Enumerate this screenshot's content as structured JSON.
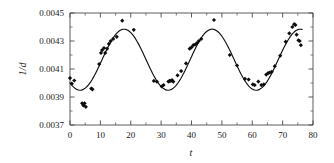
{
  "figure": {
    "background_color": "#ffffff",
    "ink_color": "#111111"
  },
  "chart_data": {
    "type": "scatter",
    "title": "",
    "subtitle": "",
    "xlabel": "t",
    "ylabel": "1/d",
    "xlim": [
      0,
      80
    ],
    "ylim": [
      0.0037,
      0.0045
    ],
    "grid": false,
    "legend": null,
    "legend_position": "none",
    "x_ticks": [
      0,
      10,
      20,
      30,
      40,
      50,
      60,
      70,
      80
    ],
    "x_tick_labels": [
      "0",
      "10",
      "20",
      "30",
      "40",
      "50",
      "60",
      "70",
      "80"
    ],
    "x_minor_tick_step": 5,
    "y_ticks": [
      0.0037,
      0.0039,
      0.0041,
      0.0043,
      0.0045
    ],
    "y_tick_labels": [
      "0.0037",
      "0.0039",
      "0.0041",
      "0.0043",
      "0.0045"
    ],
    "y_minor_tick_step": 0.0001,
    "marker": "filled-diamond",
    "series": [
      {
        "name": "observed",
        "type": "scatter",
        "x": [
          0.0,
          0.6,
          1.4,
          4.0,
          4.4,
          4.8,
          5.2,
          7.0,
          7.4,
          9.6,
          10.2,
          10.6,
          11.2,
          11.6,
          12.2,
          12.8,
          13.4,
          14.2,
          15.4,
          17.2,
          21.0,
          27.6,
          28.6,
          30.2,
          30.8,
          32.4,
          32.8,
          33.2,
          33.6,
          34.0,
          35.4,
          36.6,
          38.2,
          39.4,
          40.0,
          40.6,
          41.2,
          41.8,
          42.4,
          43.2,
          47.4,
          52.6,
          55.0,
          57.6,
          58.8,
          60.2,
          60.8,
          62.0,
          63.0,
          63.8,
          64.6,
          65.2,
          65.8,
          66.4,
          67.4,
          69.2,
          71.0,
          72.2,
          73.2,
          73.8,
          74.2,
          74.6,
          75.2,
          75.6,
          76.0
        ],
        "y": [
          0.004035,
          0.003995,
          0.004018,
          0.003855,
          0.00384,
          0.003855,
          0.00383,
          0.00396,
          0.003955,
          0.004135,
          0.004215,
          0.004235,
          0.00425,
          0.004215,
          0.004245,
          0.00428,
          0.0043,
          0.004315,
          0.00433,
          0.004445,
          0.00438,
          0.004015,
          0.00401,
          0.003975,
          0.003985,
          0.00401,
          0.004015,
          0.004015,
          0.00402,
          0.00401,
          0.004055,
          0.004085,
          0.00414,
          0.004245,
          0.004255,
          0.00427,
          0.004275,
          0.004285,
          0.0043,
          0.004315,
          0.00445,
          0.0042,
          0.004125,
          0.00403,
          0.004025,
          0.00399,
          0.003985,
          0.00401,
          0.003985,
          0.00399,
          0.00406,
          0.00407,
          0.004075,
          0.00408,
          0.00412,
          0.004195,
          0.004295,
          0.004355,
          0.0044,
          0.00442,
          0.004415,
          0.004345,
          0.004305,
          0.0043,
          0.00427
        ]
      },
      {
        "name": "fitted-curve",
        "type": "line",
        "description": "sinusoidal fit, period about 29",
        "mean": 0.0041665,
        "amplitude": 0.000218,
        "period": 29.0,
        "phase_peak_t": 17.8
      }
    ]
  }
}
